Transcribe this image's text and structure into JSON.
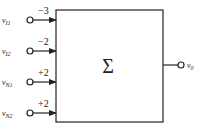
{
  "diagram": {
    "block": {
      "symbol": "Σ",
      "name": "summer"
    },
    "inputs": [
      {
        "label": "v",
        "sub": "I1",
        "gain": "−3",
        "y": 20
      },
      {
        "label": "v",
        "sub": "I2",
        "gain": "−2",
        "y": 51
      },
      {
        "label": "v",
        "sub": "N1",
        "gain": "+2",
        "y": 82
      },
      {
        "label": "v",
        "sub": "N2",
        "gain": "+2",
        "y": 113
      }
    ],
    "output": {
      "label": "v",
      "sub": "0"
    }
  }
}
